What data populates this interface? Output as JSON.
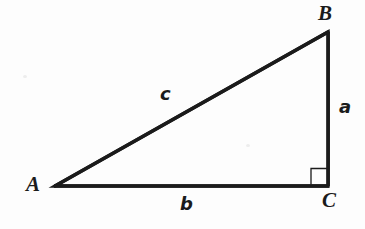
{
  "figure": {
    "kind": "right-triangle-diagram",
    "background_color": "#fdfdfd",
    "ink_color": "#1b1b1b",
    "stroke_width_px": 3.4,
    "right_angle_marker": {
      "at_vertex": "C",
      "size_px": 16,
      "stroke_width_px": 1.2
    },
    "vertices": [
      {
        "name": "A",
        "label": "A",
        "x": 55,
        "y": 186,
        "label_x": 26,
        "label_y": 174,
        "angle_type": "acute"
      },
      {
        "name": "B",
        "label": "B",
        "x": 328,
        "y": 32,
        "label_x": 318,
        "label_y": 3,
        "angle_type": "acute"
      },
      {
        "name": "C",
        "label": "C",
        "x": 328,
        "y": 186,
        "label_x": 322,
        "label_y": 190,
        "angle_type": "right"
      }
    ],
    "sides": [
      {
        "name": "a",
        "label": "a",
        "from": "B",
        "to": "C",
        "role": "leg-vertical",
        "label_x": 339,
        "label_y": 98
      },
      {
        "name": "b",
        "label": "b",
        "from": "A",
        "to": "C",
        "role": "leg-horizontal",
        "label_x": 180,
        "label_y": 195
      },
      {
        "name": "c",
        "label": "c",
        "from": "A",
        "to": "B",
        "role": "hypotenuse",
        "label_x": 160,
        "label_y": 85
      }
    ]
  }
}
